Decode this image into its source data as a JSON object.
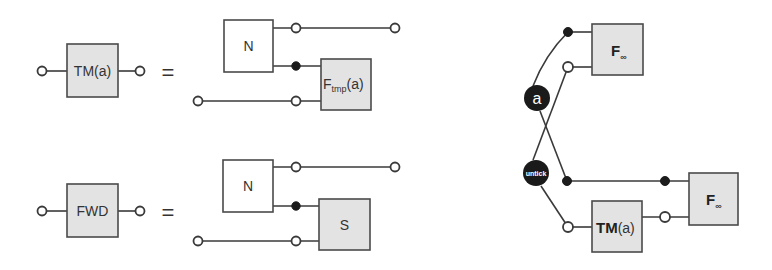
{
  "diagram": {
    "left_top_equation": {
      "lhs_box": {
        "label": "TM(a)"
      },
      "equals": "=",
      "rhs": {
        "box_n": {
          "label": "N"
        },
        "box_f": {
          "label_main": "F",
          "label_sub": "tmp",
          "label_suffix": "(a)"
        }
      }
    },
    "left_bottom_equation": {
      "lhs_box": {
        "label": "FWD"
      },
      "equals": "=",
      "rhs": {
        "box_n": {
          "label": "N"
        },
        "box_s": {
          "label": "S"
        }
      }
    },
    "right_network": {
      "node_a": {
        "label": "a"
      },
      "node_untick": {
        "label": "untick"
      },
      "box_f_top": {
        "label_main": "F",
        "label_sub": "∞"
      },
      "box_f_bottom": {
        "label_main": "F",
        "label_sub": "∞"
      },
      "box_tm": {
        "label_bold": "TM",
        "label_suffix": "(a)"
      }
    },
    "colors": {
      "box_fill_gray": "#e3e3e3",
      "stroke": "#3a3a3a",
      "node_fill": "#1a1a1a"
    }
  }
}
